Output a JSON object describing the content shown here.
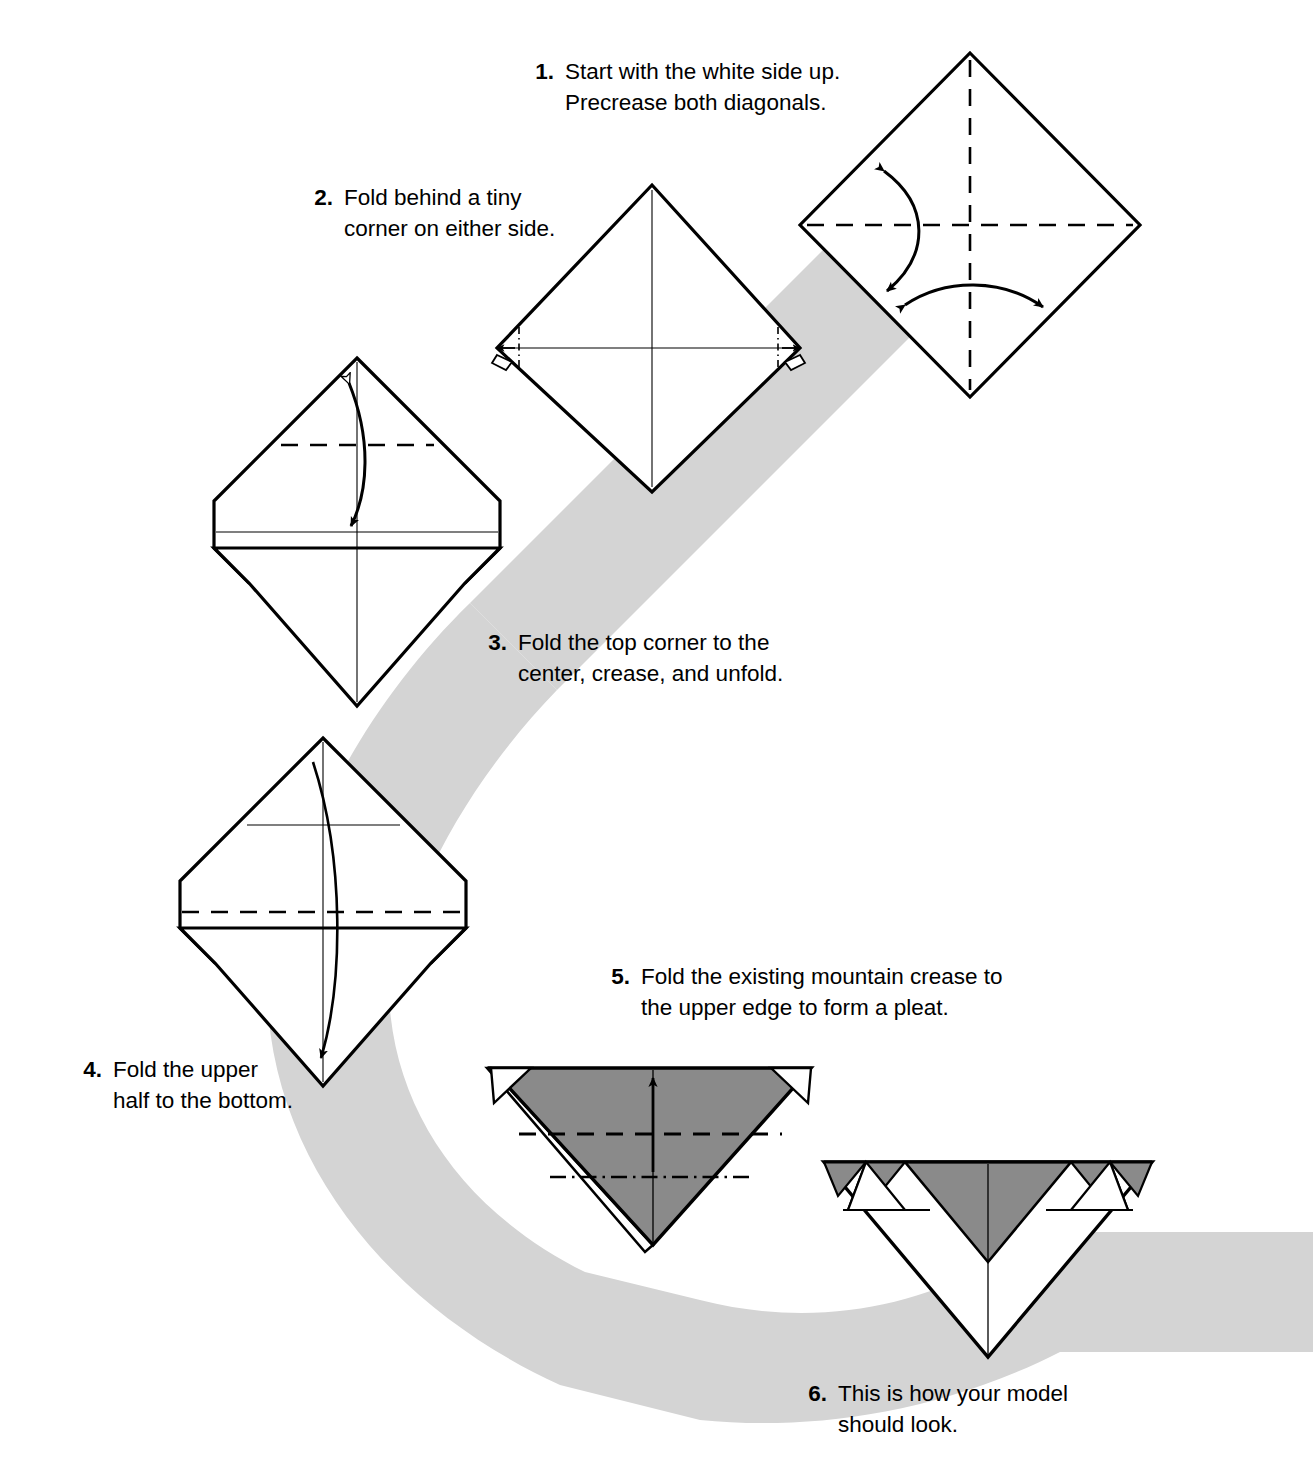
{
  "document": {
    "type": "origami-folding-instructions",
    "page_background": "#ffffff",
    "ink_color": "#000000"
  },
  "palette": {
    "ribbon_gray": "#d4d4d4",
    "paper_gray": "#8a8a8a",
    "paper_white": "#ffffff",
    "line_black": "#000000"
  },
  "steps": [
    {
      "number": "1.",
      "line1": "Start with the white side up.",
      "line2": "Precrease both diagonals.",
      "figure": "square-diamond-with-both-diagonals-precreased",
      "creases": [
        "dashed-vertical",
        "dashed-horizontal"
      ],
      "arrows": [
        "double-headed-curved-vertical",
        "double-headed-curved-horizontal"
      ]
    },
    {
      "number": "2.",
      "line1": "Fold behind a tiny",
      "line2": "corner on either side.",
      "figure": "diamond-with-tiny-corner-folds-marked",
      "creases": [
        "solid-vertical",
        "solid-horizontal",
        "dash-dot-left-corner",
        "dash-dot-right-corner"
      ],
      "arrows": [
        "small-fold-behind-left",
        "small-fold-behind-right"
      ]
    },
    {
      "number": "3.",
      "line1": "Fold the top corner to the",
      "line2": "center, crease, and unfold.",
      "figure": "diamond-blunted-corners-with-upper-valley-fold",
      "creases": [
        "dashed-horizontal-upper-quarter",
        "solid-vertical",
        "solid-horizontal"
      ],
      "arrows": [
        "fold-and-unfold-double-arrow"
      ]
    },
    {
      "number": "4.",
      "line1": "Fold the upper",
      "line2": "half to the bottom.",
      "figure": "diamond-blunted-corners-with-center-valley-fold",
      "creases": [
        "solid-horizontal-upper",
        "dashed-horizontal-center",
        "solid-vertical"
      ],
      "arrows": [
        "long-curved-arrow-down"
      ]
    },
    {
      "number": "5.",
      "line1": "Fold the existing mountain crease to",
      "line2": "the upper edge to form a pleat.",
      "figure": "gray-inverted-triangle-with-pleat-creases",
      "creases": [
        "dashed-valley-horizontal",
        "dash-dot-mountain-horizontal",
        "solid-vertical"
      ],
      "arrows": [
        "straight-arrow-up"
      ]
    },
    {
      "number": "6.",
      "line1": "This is how your model",
      "line2": "should look.",
      "figure": "finished-pleated-triangle",
      "creases": [
        "solid-vertical",
        "solid-horizontal-band",
        "pleat-zigzag"
      ],
      "arrows": []
    }
  ]
}
